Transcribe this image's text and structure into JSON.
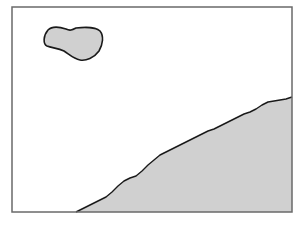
{
  "diagram": {
    "colors": {
      "background": "#ffffff",
      "frame": "#6a6a6a",
      "fill": "#d0d0d0",
      "outline": "#1a1a1a"
    },
    "frame": {
      "x": 12,
      "y": 7,
      "width": 280,
      "height": 205
    },
    "shapes": [
      {
        "name": "blob",
        "path": "M 48 30 C 52 26, 60 27, 66 29 C 70 31, 72 30, 76 28 C 84 27, 96 27, 100 31 C 104 36, 103 44, 99 51 C 94 58, 86 61, 80 60 C 74 59, 70 55, 64 51 C 58 48, 52 48, 47 46 C 43 44, 43 36, 48 30 Z"
      },
      {
        "name": "slope-region",
        "path": "M 76 212 L 84 208 L 92 204 L 100 200 L 106 197 L 112 192 L 118 186 L 124 181 L 130 178 L 136 176 L 142 171 L 148 165 L 154 160 L 160 155 L 166 152 L 172 149 L 178 146 L 184 143 L 190 140 L 196 137 L 202 134 L 208 131 L 214 129 L 220 126 L 226 123 L 232 120 L 238 117 L 244 114 L 250 112 L 256 109 L 262 105 L 268 102 L 274 101 L 280 100 L 286 99 L 292 97 L 292 212 Z"
      }
    ]
  }
}
